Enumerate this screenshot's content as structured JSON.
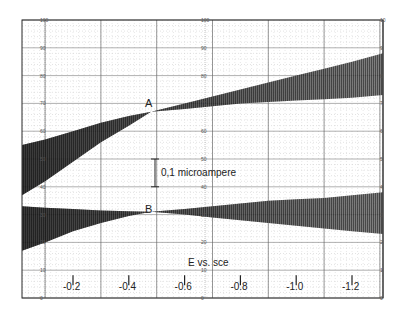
{
  "chart_data": {
    "type": "area",
    "title": "",
    "xlabel": "E vs. sce",
    "ylabel": "",
    "x_ticks": [
      "-0.2",
      "-0.4",
      "-0.6",
      "-0.8",
      "-1.0",
      "-1.2"
    ],
    "x_tick_values": [
      -0.2,
      -0.4,
      -0.6,
      -0.8,
      -1.0,
      -1.2
    ],
    "xlim": [
      0.0,
      -1.32
    ],
    "ylim": [
      0,
      100
    ],
    "y_ticks_left": [
      "100",
      "90",
      "80",
      "70",
      "60",
      "50",
      "40",
      "30",
      "20",
      "10",
      "0"
    ],
    "y_ticks_center": [
      "100",
      "90",
      "80",
      "70",
      "60",
      "50",
      "40",
      "30",
      "20",
      "10",
      "0"
    ],
    "y_ticks_right": [
      "10",
      "9",
      "8",
      "7",
      "6",
      "5",
      "4",
      "3",
      "2",
      "1",
      "0"
    ],
    "grid": true,
    "annotations": [
      {
        "text": "A",
        "x": -0.48,
        "y": 69
      },
      {
        "text": "B",
        "x": -0.48,
        "y": 33
      },
      {
        "text": "0,1 microampere",
        "kind": "scale-bar",
        "x": -0.52,
        "y_range": [
          40,
          50
        ]
      }
    ],
    "series": [
      {
        "name": "A",
        "x": [
          -0.03,
          -0.1,
          -0.2,
          -0.3,
          -0.4,
          -0.48,
          -0.6,
          -0.7,
          -0.8,
          -0.9,
          -1.0,
          -1.1,
          -1.2,
          -1.3
        ],
        "upper": [
          55,
          57,
          60,
          63,
          65.5,
          67,
          70,
          72.5,
          75,
          77.5,
          80,
          82.5,
          85,
          88
        ],
        "lower": [
          37,
          42,
          49,
          56,
          62,
          67,
          68,
          69,
          70,
          70.5,
          71,
          71.5,
          72,
          73
        ]
      },
      {
        "name": "B",
        "x": [
          -0.03,
          -0.1,
          -0.2,
          -0.3,
          -0.4,
          -0.48,
          -0.6,
          -0.7,
          -0.8,
          -0.9,
          -1.0,
          -1.1,
          -1.2,
          -1.3
        ],
        "upper": [
          33,
          32.5,
          32,
          31.5,
          31.2,
          31,
          32,
          33,
          34,
          35,
          35.5,
          36,
          37,
          38
        ],
        "lower": [
          17,
          20,
          24,
          27,
          29.5,
          31,
          30,
          29,
          28,
          27,
          26,
          25,
          24,
          23
        ]
      }
    ]
  },
  "labels": {
    "point_a": "A",
    "point_b": "B",
    "scale_bar": "0,1 microampere",
    "x_axis_title": "E vs. sce"
  }
}
